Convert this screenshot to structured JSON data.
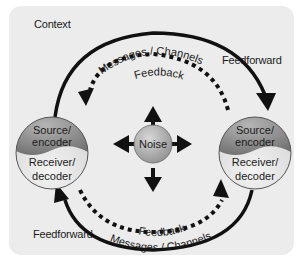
{
  "diagram": {
    "context_label": "Context",
    "feedforward_top": "Feedforward",
    "feedforward_bottom": "Feedforward",
    "top_arc": {
      "messages_label": "Messages / Channels",
      "feedback_label": "Feedback"
    },
    "bottom_arc": {
      "messages_label": "Messages / Channels",
      "feedback_label": "Feedback"
    },
    "left_node": {
      "top_label_line1": "Source/",
      "top_label_line2": "encoder",
      "bottom_label_line1": "Receiver/",
      "bottom_label_line2": "decoder"
    },
    "right_node": {
      "top_label_line1": "Source/",
      "top_label_line2": "encoder",
      "bottom_label_line1": "Receiver/",
      "bottom_label_line2": "decoder"
    },
    "center_node": {
      "label": "Noise"
    },
    "colors": {
      "panel": "#ececec",
      "arrow": "#111111",
      "source_fill": "#8a8a8a",
      "receiver_fill": "#e4e4e4"
    }
  }
}
